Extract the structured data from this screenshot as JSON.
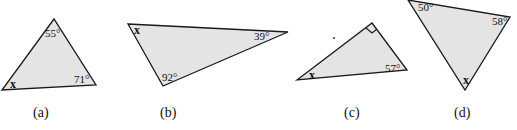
{
  "figure": {
    "triangles": [
      {
        "id": "a",
        "caption": "(a)",
        "points": "54,19 2,90 96,85",
        "angles": [
          {
            "vertex": "top",
            "label": "55°",
            "x": 46,
            "y": 37
          },
          {
            "vertex": "bottom-right",
            "label": "71°",
            "x": 74,
            "y": 83
          },
          {
            "vertex": "bottom-left",
            "label": "x",
            "x": 10,
            "y": 88
          }
        ],
        "caption_pos": {
          "x": 42,
          "y": 116
        }
      },
      {
        "id": "b",
        "caption": "(b)",
        "points": "128,24 288,32 163,86",
        "angles": [
          {
            "vertex": "top-left",
            "label": "x",
            "x": 134,
            "y": 33
          },
          {
            "vertex": "right",
            "label": "39°",
            "x": 255,
            "y": 40
          },
          {
            "vertex": "bottom",
            "label": "92°",
            "x": 162,
            "y": 81
          }
        ],
        "caption_pos": {
          "x": 162,
          "y": 116
        }
      },
      {
        "id": "c",
        "caption": "(c)",
        "points": "297,80 372,23 407,70",
        "right_angle": true,
        "angles": [
          {
            "vertex": "left",
            "label": "x",
            "x": 309,
            "y": 79
          },
          {
            "vertex": "right",
            "label": "57°",
            "x": 386,
            "y": 72
          }
        ],
        "caption_pos": {
          "x": 345,
          "y": 116
        }
      },
      {
        "id": "d",
        "caption": "(d)",
        "points": "408,0 510,17 465,90",
        "angles": [
          {
            "vertex": "top-left",
            "label": "50°",
            "x": 418,
            "y": 11
          },
          {
            "vertex": "right",
            "label": "58°",
            "x": 493,
            "y": 25
          },
          {
            "vertex": "bottom",
            "label": "x",
            "x": 463,
            "y": 84
          }
        ],
        "caption_pos": {
          "x": 454,
          "y": 116
        }
      }
    ]
  },
  "labels": {
    "a_top": "55°",
    "a_right": "71°",
    "a_left": "x",
    "a_caption": "(a)",
    "b_left": "x",
    "b_right": "39°",
    "b_bottom": "92°",
    "b_caption": "(b)",
    "c_left": "x",
    "c_right": "57°",
    "c_caption": "(c)",
    "d_left": "50°",
    "d_right": "58°",
    "d_bottom": "x",
    "d_caption": "(d)"
  }
}
